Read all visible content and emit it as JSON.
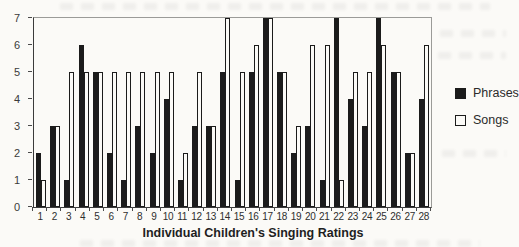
{
  "figure": {
    "background_color": "#fbfaf7",
    "plot_border_color": "#9b9b98",
    "axis_color": "#3b3b3b"
  },
  "chart_data": {
    "type": "bar",
    "title": "",
    "xlabel": "Individual Children's Singing Ratings",
    "ylabel": "",
    "ylim": [
      0,
      7
    ],
    "yticks": [
      0,
      1,
      2,
      3,
      4,
      5,
      6,
      7
    ],
    "grid": false,
    "legend_position": "right",
    "categories": [
      "1",
      "2",
      "3",
      "4",
      "5",
      "6",
      "7",
      "8",
      "9",
      "10",
      "11",
      "12",
      "13",
      "14",
      "15",
      "16",
      "17",
      "18",
      "19",
      "20",
      "21",
      "22",
      "23",
      "24",
      "25",
      "26",
      "27",
      "28"
    ],
    "series": [
      {
        "name": "Phrases",
        "color": "#1b1b1b",
        "border_color": "#1b1b1b",
        "values": [
          2,
          3,
          1,
          6,
          5,
          2,
          1,
          3,
          2,
          4,
          1,
          3,
          3,
          5,
          1,
          5,
          7,
          5,
          2,
          3,
          1,
          7,
          4,
          3,
          7,
          5,
          2,
          4
        ]
      },
      {
        "name": "Songs",
        "color": "#fbfaf7",
        "border_color": "#1b1b1b",
        "values": [
          1,
          3,
          5,
          5,
          5,
          5,
          5,
          5,
          5,
          5,
          2,
          5,
          3,
          7,
          5,
          6,
          7,
          5,
          3,
          6,
          6,
          1,
          5,
          5,
          6,
          5,
          2,
          6
        ]
      }
    ]
  }
}
